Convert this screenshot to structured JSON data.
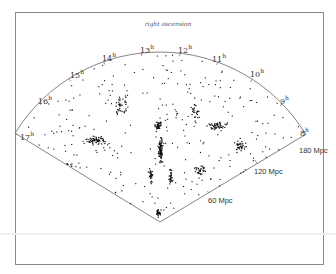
{
  "chart_data": {
    "type": "scatter",
    "subtype": "polar-wedge (redshift survey slice)",
    "title": "right ascension",
    "angular_axis": {
      "label": "right ascension",
      "ticks": [
        "17h",
        "16h",
        "15h",
        "14h",
        "13h",
        "12h",
        "11h",
        "10h",
        "9h",
        "8h"
      ],
      "range_hours": [
        8,
        17
      ]
    },
    "radial_axis": {
      "ticks": [
        "60 Mpc",
        "120 Mpc",
        "180 Mpc"
      ],
      "values_mpc": [
        60,
        120,
        180
      ],
      "range_mpc": [
        0,
        180
      ]
    },
    "grid": false,
    "legend": null,
    "features": [
      {
        "name": "central 'stick man' cluster",
        "ra_h": 12.8,
        "dist_mpc_range": [
          20,
          110
        ]
      },
      {
        "name": "dense filament left",
        "ra_h": 15.2,
        "dist_mpc_range": [
          90,
          130
        ]
      },
      {
        "name": "dense filament right",
        "ra_h": 10.5,
        "dist_mpc_range": [
          60,
          120
        ]
      }
    ]
  },
  "labels": {
    "title": "right ascension",
    "ra": [
      {
        "h": "17",
        "x": 20,
        "y": 140
      },
      {
        "h": "16",
        "x": 38,
        "y": 104
      },
      {
        "h": "15",
        "x": 70,
        "y": 78
      },
      {
        "h": "14",
        "x": 102,
        "y": 61
      },
      {
        "h": "13",
        "x": 140,
        "y": 53
      },
      {
        "h": "12",
        "x": 178,
        "y": 53
      },
      {
        "h": "11",
        "x": 212,
        "y": 62
      },
      {
        "h": "10",
        "x": 250,
        "y": 77
      },
      {
        "h": "9",
        "x": 280,
        "y": 104
      },
      {
        "h": "8",
        "x": 300,
        "y": 136
      }
    ],
    "sup": "h",
    "dist": [
      {
        "text": "60 Mpc",
        "x": 208,
        "y": 203
      },
      {
        "text": "120 Mpc",
        "x": 254,
        "y": 174
      },
      {
        "text": "180 Mpc",
        "x": 299,
        "y": 153
      }
    ]
  }
}
